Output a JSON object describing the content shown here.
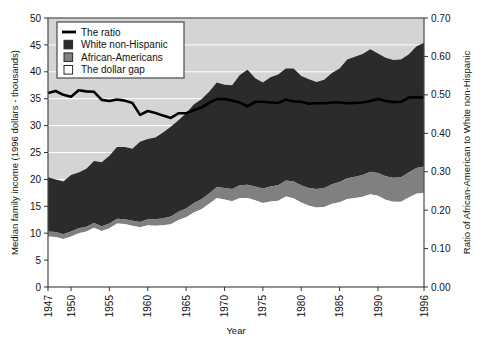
{
  "chart_data": {
    "type": "area",
    "title": "",
    "xlabel": "Year",
    "ylabel_left": "Median family income (1996 dollars - thousands)",
    "ylabel_right": "Ratio of African-American to White non-Hispanic",
    "ylim_left": [
      0,
      50
    ],
    "ylim_right": [
      0.0,
      0.7
    ],
    "yticks_left": [
      "0",
      "5",
      "10",
      "15",
      "20",
      "25",
      "30",
      "35",
      "40",
      "45",
      "50"
    ],
    "ytick_values_left": [
      0,
      5,
      10,
      15,
      20,
      25,
      30,
      35,
      40,
      45,
      50
    ],
    "yticks_right": [
      "0.00",
      "0.10",
      "0.20",
      "0.30",
      "0.40",
      "0.50",
      "0.60",
      "0.70"
    ],
    "ytick_values_right": [
      0.0,
      0.1,
      0.2,
      0.3,
      0.4,
      0.5,
      0.6,
      0.7
    ],
    "xticks": [
      "1947",
      "1950",
      "1955",
      "1960",
      "1965",
      "1970",
      "1975",
      "1980",
      "1985",
      "1990",
      "1996"
    ],
    "xtick_values": [
      1947,
      1950,
      1955,
      1960,
      1965,
      1970,
      1975,
      1980,
      1985,
      1990,
      1996
    ],
    "xlim": [
      1947,
      1996
    ],
    "grid": true,
    "legend_position": "top-left",
    "legend": [
      {
        "label": "The ratio",
        "marker": "line",
        "color": "#000000"
      },
      {
        "label": "White non-Hispanic",
        "marker": "square",
        "color": "#2b2b2b"
      },
      {
        "label": "African-Americans",
        "marker": "square",
        "color": "#808080"
      },
      {
        "label": "The dollar gap",
        "marker": "square-open",
        "color": "#ffffff"
      }
    ],
    "plot_background": "#d4d4d4",
    "x": [
      1947,
      1948,
      1949,
      1950,
      1951,
      1952,
      1953,
      1954,
      1955,
      1956,
      1957,
      1958,
      1959,
      1960,
      1961,
      1962,
      1963,
      1964,
      1965,
      1966,
      1967,
      1968,
      1969,
      1970,
      1971,
      1972,
      1973,
      1974,
      1975,
      1976,
      1977,
      1978,
      1979,
      1980,
      1981,
      1982,
      1983,
      1984,
      1985,
      1986,
      1987,
      1988,
      1989,
      1990,
      1991,
      1992,
      1993,
      1994,
      1995,
      1996
    ],
    "series": [
      {
        "name": "African-Americans",
        "axis": "left",
        "units": "1996 dollars - thousands",
        "values": [
          10.3,
          10.2,
          9.8,
          10.3,
          10.9,
          11.2,
          11.9,
          11.3,
          11.8,
          12.7,
          12.6,
          12.3,
          12.1,
          12.6,
          12.6,
          12.8,
          13.1,
          14.0,
          14.6,
          15.6,
          16.3,
          17.4,
          18.6,
          18.4,
          18.2,
          18.9,
          19.0,
          18.7,
          18.3,
          18.7,
          18.9,
          19.8,
          19.6,
          18.9,
          18.4,
          18.2,
          18.4,
          19.1,
          19.5,
          20.2,
          20.5,
          20.8,
          21.4,
          21.2,
          20.6,
          20.3,
          20.4,
          21.3,
          22.1,
          22.4
        ]
      },
      {
        "name": "White non-Hispanic",
        "axis": "left",
        "units": "1996 dollars - thousands",
        "values": [
          20.4,
          20.0,
          19.6,
          20.8,
          21.3,
          22.0,
          23.4,
          23.2,
          24.4,
          26.0,
          26.0,
          25.7,
          27.0,
          27.5,
          27.8,
          28.7,
          29.8,
          31.0,
          32.3,
          33.9,
          34.9,
          36.3,
          38.0,
          37.6,
          37.5,
          39.4,
          40.4,
          38.8,
          38.0,
          39.0,
          39.5,
          40.6,
          40.6,
          39.2,
          38.6,
          38.1,
          38.5,
          39.8,
          40.6,
          42.3,
          42.8,
          43.3,
          44.2,
          43.4,
          42.6,
          42.2,
          42.3,
          43.2,
          44.7,
          45.4
        ]
      },
      {
        "name": "The dollar gap",
        "axis": "left",
        "units": "1996 dollars - thousands",
        "values": [
          10.1,
          9.8,
          9.8,
          10.5,
          10.4,
          10.8,
          11.5,
          11.9,
          12.6,
          13.3,
          13.4,
          13.4,
          14.9,
          14.9,
          15.2,
          15.9,
          16.7,
          17.0,
          17.7,
          18.3,
          18.6,
          18.9,
          19.4,
          19.2,
          19.3,
          20.5,
          21.4,
          20.1,
          19.7,
          20.3,
          20.6,
          20.8,
          21.0,
          20.3,
          20.2,
          19.9,
          20.1,
          20.7,
          21.1,
          22.1,
          22.3,
          22.5,
          22.8,
          22.2,
          22.0,
          21.9,
          21.9,
          21.9,
          22.6,
          23.0
        ]
      },
      {
        "name": "The ratio",
        "axis": "right",
        "units": "ratio",
        "values": [
          0.505,
          0.51,
          0.5,
          0.495,
          0.512,
          0.509,
          0.508,
          0.487,
          0.484,
          0.488,
          0.485,
          0.479,
          0.448,
          0.458,
          0.453,
          0.446,
          0.44,
          0.452,
          0.452,
          0.46,
          0.467,
          0.479,
          0.489,
          0.489,
          0.485,
          0.48,
          0.47,
          0.482,
          0.482,
          0.48,
          0.479,
          0.488,
          0.483,
          0.482,
          0.477,
          0.478,
          0.478,
          0.48,
          0.48,
          0.478,
          0.479,
          0.48,
          0.484,
          0.489,
          0.484,
          0.481,
          0.482,
          0.493,
          0.494,
          0.493
        ]
      }
    ]
  }
}
